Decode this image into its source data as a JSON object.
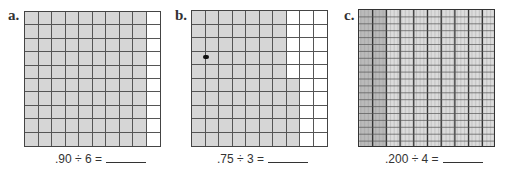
{
  "problems": [
    {
      "letter": "a.",
      "equation": ".90 ÷ 6 =",
      "grid": {
        "rows": 10,
        "cols": 10,
        "shaded_per_row": [
          9,
          9,
          9,
          9,
          9,
          9,
          9,
          9,
          9,
          9
        ],
        "total_shaded": 90
      }
    },
    {
      "letter": "b.",
      "equation": ".75 ÷ 3 =",
      "grid": {
        "rows": 10,
        "cols": 10,
        "shaded_per_row": [
          7,
          7,
          7,
          7,
          7,
          8,
          8,
          8,
          8,
          8
        ],
        "total_shaded": 75
      }
    },
    {
      "letter": "c.",
      "equation": ".200 ÷ 4 =",
      "grid": {
        "rows": 20,
        "major_cols": 10,
        "minor_cols_per_major": 10,
        "shaded_major_cols": 2,
        "total_shaded": 200,
        "total_units": 1000
      }
    }
  ],
  "colors": {
    "shade": "#d6d6d6",
    "line": "#555555",
    "border": "#444444"
  }
}
